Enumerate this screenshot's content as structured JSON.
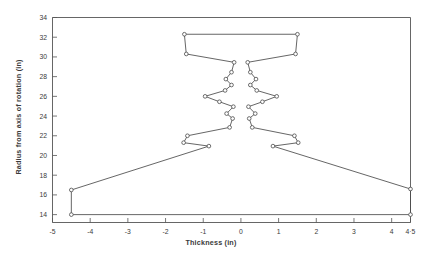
{
  "figure": {
    "background_color": "#ffffff",
    "line_color": "#4a4a4a",
    "axis_color": "#555555",
    "text_color": "#3a3a3a"
  },
  "chart_data": {
    "type": "line",
    "title": "",
    "xlabel": "Thickness (in)",
    "ylabel": "Radius from axis of rotation (in)",
    "xlim": [
      -5,
      4.5
    ],
    "ylim": [
      13.2,
      34
    ],
    "grid": false,
    "legend": null,
    "marker": "open-circle",
    "xticks": [
      -5,
      -4,
      -3,
      -2,
      -1,
      0,
      1,
      2,
      3,
      4,
      4.5
    ],
    "xticklabels": [
      "-5",
      "-4",
      "-3",
      "-2",
      "-1",
      "0",
      "1",
      "2",
      "3",
      "4",
      "4·5"
    ],
    "yticks": [
      14,
      16,
      18,
      20,
      22,
      24,
      26,
      28,
      30,
      32,
      34
    ],
    "yticklabels": [
      "14",
      "16",
      "18",
      "20",
      "22",
      "24",
      "26",
      "28",
      "30",
      "32",
      "34"
    ],
    "series": [
      {
        "name": "disk half-profile",
        "description": "Closed symmetric cross-section outline of a rotating disk: thickness plotted against radius from axis of rotation.",
        "points": [
          [
            -4.5,
            14.0
          ],
          [
            -4.5,
            16.5
          ],
          [
            -0.85,
            20.95
          ],
          [
            -1.52,
            21.3
          ],
          [
            -1.42,
            22.0
          ],
          [
            -0.3,
            22.85
          ],
          [
            -0.22,
            23.75
          ],
          [
            -0.38,
            24.25
          ],
          [
            -0.2,
            24.95
          ],
          [
            -0.57,
            25.45
          ],
          [
            -0.95,
            26.0
          ],
          [
            -0.42,
            26.6
          ],
          [
            -0.25,
            27.15
          ],
          [
            -0.4,
            27.75
          ],
          [
            -0.25,
            28.45
          ],
          [
            -0.18,
            29.45
          ],
          [
            -1.45,
            30.3
          ],
          [
            -1.5,
            32.3
          ],
          [
            1.5,
            32.3
          ],
          [
            1.45,
            30.3
          ],
          [
            0.18,
            29.45
          ],
          [
            0.25,
            28.45
          ],
          [
            0.4,
            27.75
          ],
          [
            0.25,
            27.15
          ],
          [
            0.42,
            26.6
          ],
          [
            0.95,
            26.0
          ],
          [
            0.57,
            25.45
          ],
          [
            0.2,
            24.95
          ],
          [
            0.38,
            24.25
          ],
          [
            0.22,
            23.75
          ],
          [
            0.3,
            22.85
          ],
          [
            1.42,
            22.0
          ],
          [
            1.52,
            21.3
          ],
          [
            0.85,
            20.95
          ],
          [
            4.5,
            16.6
          ],
          [
            4.5,
            14.0
          ],
          [
            -4.5,
            14.0
          ]
        ]
      }
    ]
  }
}
